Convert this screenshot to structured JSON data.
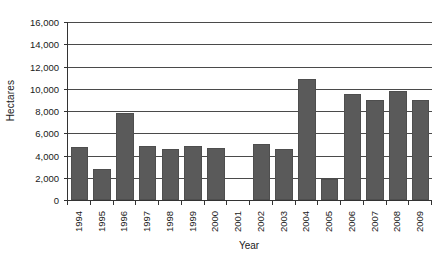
{
  "chart_data": {
    "type": "bar",
    "title": "",
    "xlabel": "Year",
    "ylabel": "Hectares",
    "categories": [
      "1994",
      "1995",
      "1996",
      "1997",
      "1998",
      "1999",
      "2000",
      "2001",
      "2002",
      "2003",
      "2004",
      "2005",
      "2006",
      "2007",
      "2008",
      "2009"
    ],
    "values": [
      4760,
      2820,
      7820,
      4900,
      4580,
      4870,
      4650,
      0,
      5000,
      4560,
      10880,
      1930,
      9550,
      9000,
      9800,
      9000
    ],
    "ylim": [
      0,
      16000
    ],
    "y_ticks": [
      0,
      2000,
      4000,
      6000,
      8000,
      10000,
      12000,
      14000,
      16000
    ],
    "y_tick_labels": [
      "0",
      "2,000",
      "4,000",
      "6,000",
      "8,000",
      "10,000",
      "12,000",
      "14,000",
      "16,000"
    ],
    "grid": true,
    "legend": "none",
    "bar_color": "#5a5a5a",
    "axis_color": "#333333",
    "gridline_color": "#4a4a4a",
    "background_color": "#ffffff"
  }
}
